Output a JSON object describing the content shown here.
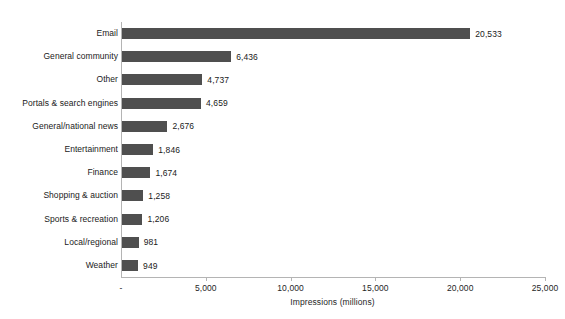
{
  "chart_data": {
    "type": "bar",
    "orientation": "horizontal",
    "title": "",
    "xlabel": "Impressions (millions)",
    "ylabel": "",
    "xlim": [
      0,
      25000
    ],
    "grid": false,
    "legend": false,
    "bar_color": "#4f4f4f",
    "axis_color": "#b4b4b4",
    "categories": [
      "Email",
      "General community",
      "Other",
      "Portals & search engines",
      "General/national news",
      "Entertainment",
      "Finance",
      "Shopping & auction",
      "Sports & recreation",
      "Local/regional",
      "Weather"
    ],
    "values": [
      20533,
      6436,
      4737,
      4659,
      2676,
      1846,
      1674,
      1258,
      1206,
      981,
      949
    ],
    "value_labels": [
      "20,533",
      "6,436",
      "4,737",
      "4,659",
      "2,676",
      "1,846",
      "1,674",
      "1,258",
      "1,206",
      "981",
      "949"
    ],
    "xticks": [
      0,
      5000,
      10000,
      15000,
      20000,
      25000
    ],
    "xtick_labels": [
      "-",
      "5,000",
      "10,000",
      "15,000",
      "20,000",
      "25,000"
    ]
  }
}
